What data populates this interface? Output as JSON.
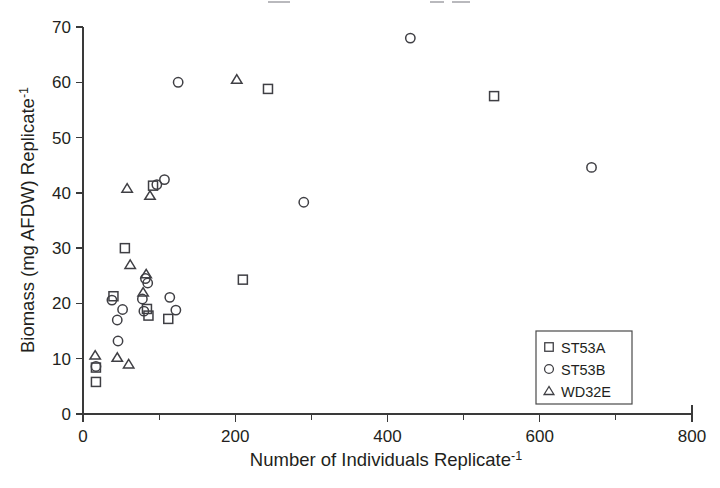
{
  "figure": {
    "background_color": "#ffffff",
    "marker_color": "#3f3f44",
    "axis_color": "#3a3a3a",
    "text_color": "#231f20"
  },
  "axes": {
    "x_title_main": "Number of Individuals Replicate",
    "x_title_sup": "-1",
    "y_title_main": "Biomass (mg AFDW) Replicate",
    "y_title_sup": "-1",
    "x_ticks": [
      "0",
      "200",
      "400",
      "600",
      "800"
    ],
    "y_ticks": [
      "0",
      "10",
      "20",
      "30",
      "40",
      "50",
      "60",
      "70"
    ]
  },
  "legend": {
    "entries": [
      {
        "label": "ST53A",
        "marker": "square"
      },
      {
        "label": "ST53B",
        "marker": "circle"
      },
      {
        "label": "WD32E",
        "marker": "triangle"
      }
    ]
  },
  "chart_data": {
    "type": "scatter",
    "title": "",
    "xlabel": "Number of Individuals Replicate-1",
    "ylabel": "Biomass (mg AFDW) Replicate-1",
    "xlim": [
      0,
      800
    ],
    "ylim": [
      0,
      70
    ],
    "xticks": [
      0,
      200,
      400,
      600,
      800
    ],
    "yticks": [
      0,
      10,
      20,
      30,
      40,
      50,
      60,
      70
    ],
    "x_minor_tick_interval": 100,
    "grid": false,
    "legend_position": "bottom-right",
    "series": [
      {
        "name": "ST53A",
        "marker": "square",
        "points": [
          [
            17,
            8.4
          ],
          [
            17,
            5.8
          ],
          [
            40,
            21.3
          ],
          [
            55,
            30.0
          ],
          [
            84,
            19.0
          ],
          [
            86,
            17.8
          ],
          [
            92,
            41.3
          ],
          [
            112,
            17.2
          ],
          [
            210,
            24.3
          ],
          [
            243,
            58.8
          ],
          [
            540,
            57.5
          ]
        ]
      },
      {
        "name": "ST53B",
        "marker": "circle",
        "points": [
          [
            17,
            8.6
          ],
          [
            38,
            20.6
          ],
          [
            45,
            17.0
          ],
          [
            46,
            13.2
          ],
          [
            52,
            18.9
          ],
          [
            78,
            20.8
          ],
          [
            80,
            18.6
          ],
          [
            82,
            24.5
          ],
          [
            85,
            23.7
          ],
          [
            97,
            41.5
          ],
          [
            107,
            42.4
          ],
          [
            114,
            21.1
          ],
          [
            122,
            18.8
          ],
          [
            125,
            60.0
          ],
          [
            290,
            38.3
          ],
          [
            430,
            68.0
          ],
          [
            668,
            44.6
          ]
        ]
      },
      {
        "name": "WD32E",
        "marker": "triangle",
        "points": [
          [
            16,
            10.6
          ],
          [
            45,
            10.2
          ],
          [
            58,
            40.8
          ],
          [
            60,
            9.0
          ],
          [
            62,
            27.0
          ],
          [
            79,
            22.0
          ],
          [
            83,
            25.3
          ],
          [
            88,
            39.5
          ],
          [
            202,
            60.5
          ]
        ]
      }
    ]
  }
}
